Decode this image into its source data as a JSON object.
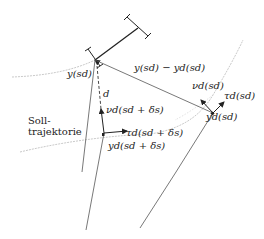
{
  "diagram": {
    "labels": {
      "y_sd": "y(s_d)",
      "error_vector": "y(s_d) − y_d(s_d)",
      "nu_d_sd": "ν_d(s_d)",
      "tau_d_sd": "τ_d(s_d)",
      "yd_sd": "y_d(s_d)",
      "d": "d",
      "nu_d_sd_delta": "ν_d(s_d + δ_s)",
      "tau_d_sd_delta": "τ_d(s_d + δ_s)",
      "yd_sd_delta": "y_d(s_d + δ_s)",
      "soll_line1": "Soll-",
      "soll_line2": "trajektorie"
    },
    "display": {
      "y_sd": "y(sd)",
      "error_vector": "y(sd) − yd(sd)",
      "nu_d_sd": "νd(sd)",
      "tau_d_sd": "τd(sd)",
      "yd_sd": "yd(sd)",
      "d": "d",
      "nu_d_sd_delta": "νd(sd + δs)",
      "tau_d_sd_delta": "τd(sd + δs)",
      "yd_sd_delta": "yd(sd + δs)",
      "soll_line1": "Soll-",
      "soll_line2": "trajektorie"
    },
    "colors": {
      "line": "#333333",
      "thin_line": "#555555",
      "trajectory": "#bbbbbb"
    }
  }
}
